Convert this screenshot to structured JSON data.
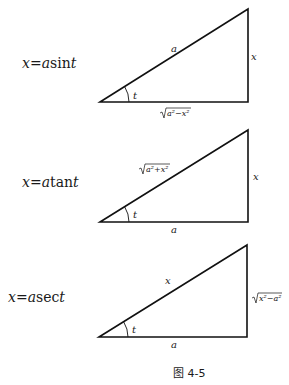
{
  "figure": {
    "caption": "图 4-5",
    "panels": [
      {
        "equation": {
          "lhs": "x",
          "eq": "=",
          "coef": "a",
          "func": "sin",
          "arg": "t"
        },
        "hypotenuse_label": "a",
        "vertical_label": "x",
        "horizontal_label": "√(a²−x²)",
        "horizontal_radicand": "a²−x²",
        "angle_label": "t"
      },
      {
        "equation": {
          "lhs": "x",
          "eq": "=",
          "coef": "a",
          "func": "tan",
          "arg": "t"
        },
        "hypotenuse_label": "√(a²+x²)",
        "hypotenuse_radicand": "a²+x²",
        "vertical_label": "x",
        "horizontal_label": "a",
        "angle_label": "t"
      },
      {
        "equation": {
          "lhs": "x",
          "eq": "=",
          "coef": "a",
          "func": "sec",
          "arg": "t"
        },
        "hypotenuse_label": "x",
        "vertical_label": "√(x²−a²)",
        "vertical_radicand": "x²−a²",
        "horizontal_label": "a",
        "angle_label": "t"
      }
    ]
  }
}
